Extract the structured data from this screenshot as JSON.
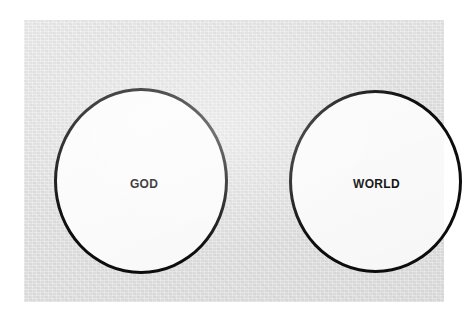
{
  "figure": {
    "type": "venn-style-diagram",
    "panel_color": "#e4e4e4",
    "page_color": "#ffffff",
    "outline_color": "#0d0d0d",
    "circle_fill": "#ffffff",
    "label_color": "#101010"
  },
  "diagram_data": {
    "type": "diagram",
    "shapes": [
      {
        "id": "circle-god",
        "shape": "circle",
        "label": "God",
        "center": [
          117,
          161
        ],
        "diameter": 174,
        "fill": "#ffffff",
        "stroke": "#0d0d0d",
        "stroke_width": 3
      },
      {
        "id": "circle-world",
        "shape": "circle",
        "label": "World",
        "center": [
          351,
          161
        ],
        "diameter": 173,
        "fill": "#ffffff",
        "stroke": "#0d0d0d",
        "stroke_width": 3
      }
    ],
    "relationship": "disjoint",
    "overlap": false
  },
  "labels": {
    "god": "God",
    "world": "World"
  }
}
